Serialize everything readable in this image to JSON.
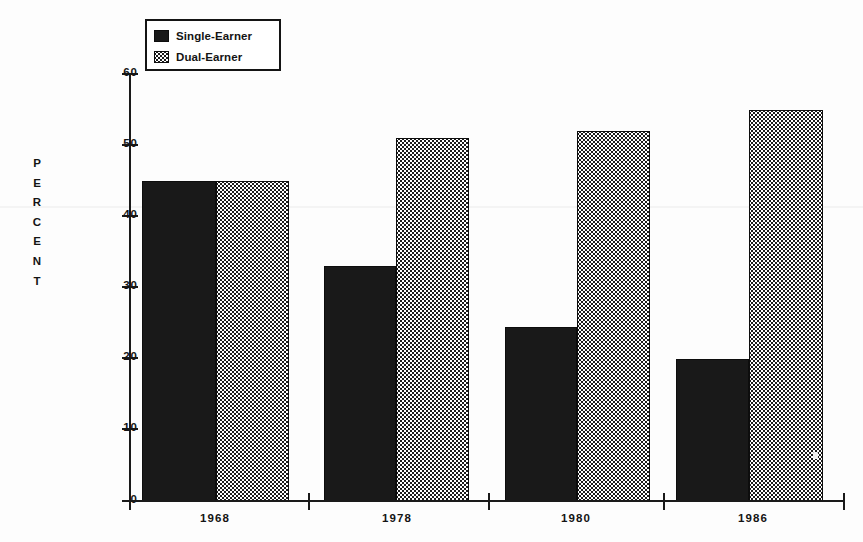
{
  "chart_data": {
    "type": "bar",
    "title": "",
    "subtitle": "",
    "xlabel": "",
    "ylabel": "PERCENT",
    "categories": [
      "1968",
      "1978",
      "1980",
      "1986"
    ],
    "series": [
      {
        "name": "Single-Earner",
        "values": [
          45,
          33,
          24.5,
          20
        ],
        "fill": "solid-black",
        "color": "#191919"
      },
      {
        "name": "Dual-Earner",
        "values": [
          45,
          51,
          52,
          55
        ],
        "fill": "dotted-checker",
        "color": "#1b1b1b"
      }
    ],
    "ylim": [
      0,
      60
    ],
    "yticks": [
      0,
      10,
      20,
      30,
      40,
      50,
      60
    ],
    "ytick_labels": [
      "0",
      "10",
      "20",
      "30",
      "40",
      "50",
      "60"
    ],
    "grid": false,
    "legend_position": "top-left",
    "bar_gap_within_group": 0,
    "axis_color": "#1a1a1a",
    "background": "#fdfdfd"
  },
  "legend": {
    "entries": [
      {
        "label": "Single-Earner",
        "swatch": "solid-black-swatch"
      },
      {
        "label": "Dual-Earner",
        "swatch": "dotted-checker-swatch"
      }
    ]
  },
  "y_axis": {
    "title_letters": [
      "P",
      "E",
      "R",
      "C",
      "E",
      "N",
      "T"
    ],
    "title": "PERCENT",
    "ticks": [
      {
        "value": 60,
        "label": "60"
      },
      {
        "value": 50,
        "label": "50"
      },
      {
        "value": 40,
        "label": "40"
      },
      {
        "value": 30,
        "label": "30"
      },
      {
        "value": 20,
        "label": "20"
      },
      {
        "value": 10,
        "label": "10"
      },
      {
        "value": 0,
        "label": "0"
      }
    ]
  },
  "x_axis": {
    "labels": [
      "1968",
      "1978",
      "1980",
      "1986"
    ]
  }
}
